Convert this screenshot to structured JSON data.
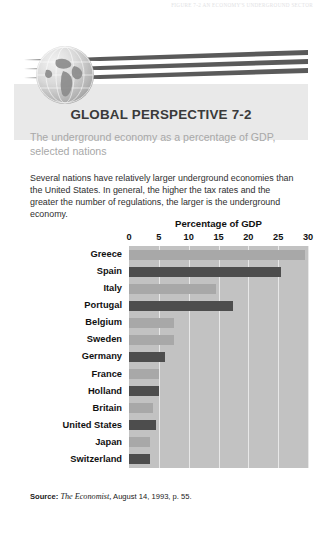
{
  "running_head": "FIGURE 7-2  AN ECONOMY'S UNDERGROUND SECTOR",
  "header": {
    "title": "GLOBAL PERSPECTIVE 7-2",
    "subtitle": "The underground economy as a percentage of GDP, selected nations",
    "globe_icon": "globe-icon"
  },
  "body": {
    "paragraph": "Several nations have relatively larger underground economies than the United States. In general, the higher the tax rates and the greater the number of regulations, the larger is the underground economy."
  },
  "source": {
    "label": "Source:",
    "publication": "The Economist,",
    "rest": "August 14, 1993, p. 55."
  },
  "colors": {
    "plot_background": "#c2c2c2",
    "gridline": "#e8e8e8",
    "bar_dark": "#4d4d4d",
    "bar_light": "#a8a8a8",
    "header_band": "#e9e9e9",
    "subtitle_text": "#a8a8a8",
    "swoosh": "#5a5a5a"
  },
  "chart_data": {
    "type": "bar",
    "title": "Percentage of GDP",
    "xlabel": "Percentage of GDP",
    "ylabel": "",
    "orientation": "horizontal",
    "xlim": [
      0,
      30
    ],
    "ticks": [
      0,
      5,
      10,
      15,
      20,
      25,
      30
    ],
    "grid": true,
    "legend": "none",
    "categories": [
      "Greece",
      "Spain",
      "Italy",
      "Portugal",
      "Belgium",
      "Sweden",
      "Germany",
      "France",
      "Holland",
      "Britain",
      "United States",
      "Japan",
      "Switzerland"
    ],
    "values": [
      29.5,
      25.5,
      14.5,
      17.5,
      7.5,
      7.5,
      6.0,
      5.0,
      5.0,
      4.0,
      4.5,
      3.5,
      3.5
    ],
    "bar_shades": [
      "light",
      "dark",
      "light",
      "dark",
      "light",
      "light",
      "dark",
      "light",
      "dark",
      "light",
      "dark",
      "light",
      "dark"
    ]
  }
}
